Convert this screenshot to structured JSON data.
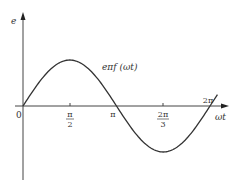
{
  "chart_data": {
    "type": "line",
    "title": "",
    "xlabel": "ωt",
    "ylabel": "e",
    "curve_label": "eπf (ωt)",
    "x_ticks": [
      {
        "label": "0",
        "value": 0
      },
      {
        "label_num": "π",
        "label_den": "2",
        "value": 1.5708
      },
      {
        "label": "π",
        "value": 3.1416
      },
      {
        "label_num": "2π",
        "label_den": "3",
        "value": 4.7124
      },
      {
        "label": "2π",
        "value": 6.2832
      }
    ],
    "x": [
      0,
      0.785,
      1.571,
      2.356,
      3.142,
      3.927,
      4.712,
      5.498,
      6.283
    ],
    "values": [
      0,
      0.707,
      1,
      0.707,
      0,
      -0.707,
      -1,
      -0.707,
      0
    ],
    "xlim": [
      0,
      6.283
    ],
    "ylim": [
      -1,
      1
    ],
    "grid": false,
    "legend": "none"
  },
  "labels": {
    "y_axis": "e",
    "x_axis": "ωt",
    "curve": "eπf (ωt)",
    "origin": "0",
    "tick_pi_half_num": "π",
    "tick_pi_half_den": "2",
    "tick_pi": "π",
    "tick_3pi_half_num": "2π",
    "tick_3pi_half_den": "3",
    "tick_2pi": "2π"
  }
}
